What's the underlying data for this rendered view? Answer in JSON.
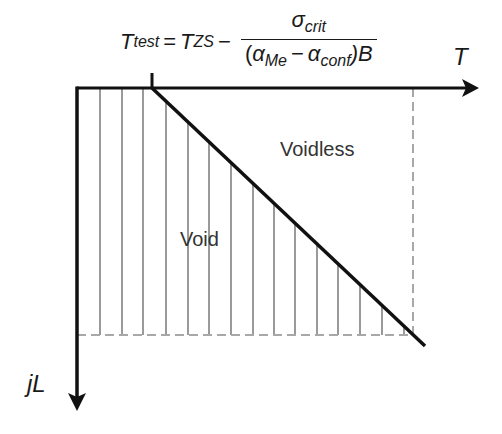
{
  "equation": {
    "lhs_symbol": "T",
    "lhs_sub": "test",
    "equals": "=",
    "t_symbol": "T",
    "t_sub": "ZS",
    "minus": "−",
    "numerator_symbol": "σ",
    "numerator_sub": "crit",
    "den_open": "(",
    "alpha1": "α",
    "alpha1_sub": "Me",
    "den_minus": "−",
    "alpha2": "α",
    "alpha2_sub": "conf",
    "den_close": ")B"
  },
  "axes": {
    "x_label": "T",
    "y_label": "jL"
  },
  "regions": {
    "void_label": "Void",
    "voidless_label": "Voidless"
  },
  "colors": {
    "axis": "#111111",
    "hatch": "#9a9a9a",
    "dashed": "#a8a8a8",
    "boundary": "#111111"
  },
  "geometry": {
    "origin": [
      77,
      88
    ],
    "x_axis_end": 478,
    "y_axis_end": 410,
    "t_test_x": 152,
    "boundary_end": [
      425,
      346
    ],
    "dashed_y": 335,
    "dashed_x": 413,
    "hatch_x": [
      100,
      122,
      143,
      166,
      188,
      209,
      231,
      253,
      274,
      295,
      317,
      338,
      360,
      382,
      404
    ]
  }
}
